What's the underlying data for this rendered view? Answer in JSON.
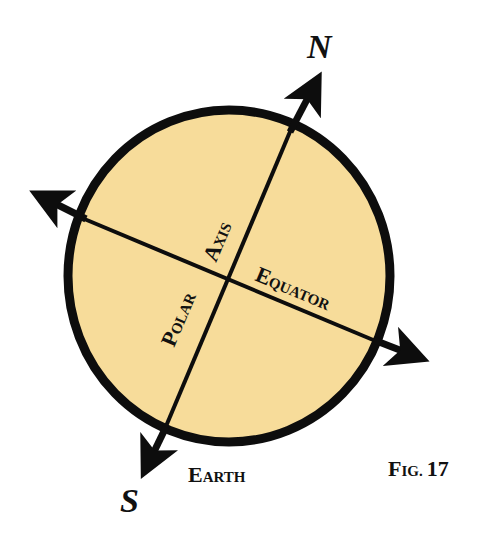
{
  "diagram": {
    "type": "earth-axis-diagram",
    "colors": {
      "earth_fill": "#f7dc9a",
      "stroke": "#0d0d0d",
      "background": "#ffffff"
    },
    "labels": {
      "north": "N",
      "south": "S",
      "polar_first": "P",
      "polar_rest": "OLAR",
      "axis_first": "A",
      "axis_rest": "XIS",
      "equator_first": "E",
      "equator_rest": "QUATOR",
      "earth_first": "E",
      "earth_rest": "ARTH",
      "fig_first": "F",
      "fig_rest": "IG.",
      "fig_number": "17"
    }
  }
}
